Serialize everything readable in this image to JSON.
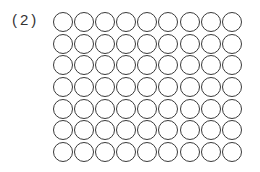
{
  "problem": {
    "label": "(2)",
    "grid": {
      "rows": 7,
      "columns": 9,
      "total_circles": 63,
      "circle_style": "outline",
      "stroke_color": "#3a3a3a"
    }
  }
}
